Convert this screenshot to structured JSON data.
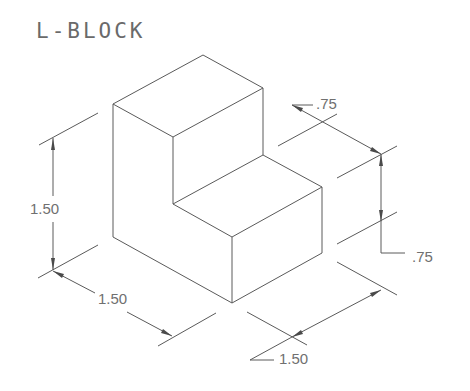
{
  "title": "L-BLOCK",
  "dimensions": {
    "height_left": "1.50",
    "width_front_left": "1.50",
    "depth_front_right": "1.50",
    "step_depth_top": ".75",
    "step_height_right": ".75"
  },
  "colors": {
    "line": "#5a5a5a",
    "text": "#707070",
    "background": "#ffffff"
  }
}
